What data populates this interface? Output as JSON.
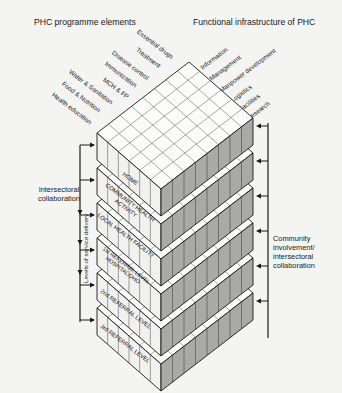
{
  "diagram": {
    "left_heading": "PHC programme elements",
    "right_heading": "Functional infrastructure of PHC",
    "programme_elements": [
      "Essential drugs",
      "Treatment",
      "Disease control",
      "Immunization",
      "MCH & FP",
      "Water & Sanitation",
      "Food & Nutrition",
      "Health education"
    ],
    "infrastructure_functions": [
      "Information",
      "Management",
      "Manpower development",
      "Logistics",
      "Facilities",
      "Research"
    ],
    "levels": [
      {
        "label": "HOME"
      },
      {
        "label": "COMMUNITY HEALTH ACTIVITY"
      },
      {
        "label": "LOCAL HEALTH FACILITY"
      },
      {
        "label": "1st REFERRAL LEVEL HOSPITAL/DHO"
      },
      {
        "label": "2nd REFERRAL LEVEL"
      },
      {
        "label": "3rd REFERRAL LEVEL"
      }
    ],
    "left_annotation": "Intersectoral collaboration",
    "vertical_axis_label": "Levels of service delivery",
    "right_annotation": "Community involvement/ intersectoral collaboration"
  },
  "colors": {
    "background": "#f4f4f2",
    "line": "#1a1a1a",
    "top_face": "#fbfbfa",
    "left_face": "#f1f1ef",
    "right_face": "#a9a9a7"
  }
}
